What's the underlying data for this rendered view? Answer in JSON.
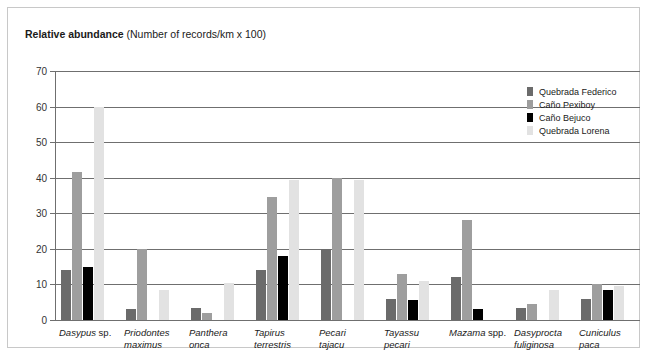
{
  "title": {
    "strong": "Relative abundance",
    "normal": " (Number of records/km x 100)"
  },
  "legend": {
    "position": "top-right",
    "items": [
      {
        "label": "Quebrada Federico",
        "color": "#6b6b6b"
      },
      {
        "label": "Caño Pexiboy",
        "color": "#9e9e9e"
      },
      {
        "label": "Caño Bejuco",
        "color": "#000000"
      },
      {
        "label": "Quebrada Lorena",
        "color": "#e2e2e2"
      }
    ]
  },
  "yaxis": {
    "ticks": [
      "0",
      "10",
      "20",
      "30",
      "40",
      "50",
      "60",
      "70"
    ]
  },
  "categories_display": [
    {
      "italic": "Dasypus",
      "plain": " sp.",
      "line2": ""
    },
    {
      "italic": "Priodontes",
      "plain": "",
      "line2": "maximus"
    },
    {
      "italic": "Panthera",
      "plain": "",
      "line2": "onca"
    },
    {
      "italic": "Tapirus",
      "plain": "",
      "line2": "terrestris"
    },
    {
      "italic": "Pecari",
      "plain": "",
      "line2": "tajacu"
    },
    {
      "italic": "Tayassu",
      "plain": "",
      "line2": "pecari"
    },
    {
      "italic": "Mazama",
      "plain": " spp.",
      "line2": ""
    },
    {
      "italic": "Dasyprocta",
      "plain": "",
      "line2": "fuliginosa"
    },
    {
      "italic": "Cuniculus",
      "plain": "",
      "line2": "paca"
    }
  ],
  "chart_data": {
    "type": "bar",
    "title": "Relative abundance (Number of records/km x 100)",
    "xlabel": "",
    "ylabel": "Relative abundance (Number of records/km x 100)",
    "ylim": [
      0,
      70
    ],
    "ytick_step": 10,
    "grid": true,
    "legend_position": "top-right",
    "categories": [
      "Dasypus sp.",
      "Priodontes maximus",
      "Panthera onca",
      "Tapirus terrestris",
      "Pecari tajacu",
      "Tayassu pecari",
      "Mazama spp.",
      "Dasyprocta fuliginosa",
      "Cuniculus paca"
    ],
    "series": [
      {
        "name": "Quebrada Federico",
        "color": "#6b6b6b",
        "values": [
          14,
          3,
          3.5,
          14,
          20,
          6,
          12,
          3.5,
          6
        ]
      },
      {
        "name": "Caño Pexiboy",
        "color": "#9e9e9e",
        "values": [
          41.5,
          20,
          2,
          34.5,
          40,
          13,
          28,
          4.5,
          10
        ]
      },
      {
        "name": "Caño Bejuco",
        "color": "#000000",
        "values": [
          15,
          0,
          0,
          18,
          0,
          5.5,
          3,
          0,
          8.5
        ]
      },
      {
        "name": "Quebrada Lorena",
        "color": "#e2e2e2",
        "values": [
          60,
          8.5,
          10.5,
          39.5,
          39.5,
          11,
          0,
          8.5,
          9.5
        ]
      }
    ]
  }
}
